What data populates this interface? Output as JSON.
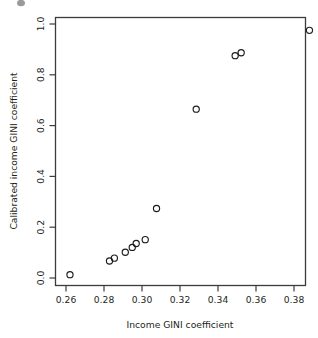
{
  "chart_data": {
    "type": "scatter",
    "title": "",
    "xlabel": "Income GINI coefficient",
    "ylabel": "Calibrated income GINI coefficient",
    "xlim": [
      0.2534,
      0.3863
    ],
    "ylim": [
      -0.032,
      1.052
    ],
    "xticks": [
      0.26,
      0.28,
      0.3,
      0.32,
      0.34,
      0.36,
      0.38
    ],
    "xticklabels": [
      "0.26",
      "0.28",
      "0.30",
      "0.32",
      "0.34",
      "0.36",
      "0.38"
    ],
    "yticks": [
      0.0,
      0.2,
      0.4,
      0.6,
      0.8,
      1.0
    ],
    "yticklabels": [
      "0.0",
      "0.2",
      "0.4",
      "0.6",
      "0.8",
      "1.0"
    ],
    "grid": false,
    "legend": null,
    "marker": "open-circle",
    "marker_color": "#1d1d1f",
    "points": [
      {
        "x": 0.2611,
        "y": 0.0118
      },
      {
        "x": 0.2821,
        "y": 0.0669
      },
      {
        "x": 0.2847,
        "y": 0.0787
      },
      {
        "x": 0.2905,
        "y": 0.1024
      },
      {
        "x": 0.2942,
        "y": 0.122
      },
      {
        "x": 0.2963,
        "y": 0.1378
      },
      {
        "x": 0.3011,
        "y": 0.1535
      },
      {
        "x": 0.3071,
        "y": 0.2795
      },
      {
        "x": 0.3282,
        "y": 0.6811
      },
      {
        "x": 0.3489,
        "y": 0.8976
      },
      {
        "x": 0.3521,
        "y": 0.9094
      },
      {
        "x": 0.3884,
        "y": 1.0
      }
    ]
  },
  "figure": {
    "background_color": "#ffffff",
    "frame_color": "#3b3b3d",
    "text_color": "#231f20"
  }
}
